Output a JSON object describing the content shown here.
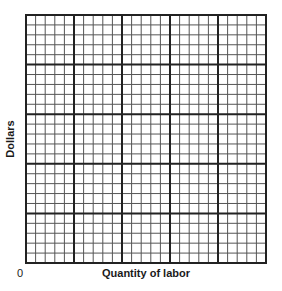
{
  "chart_data": {
    "type": "grid",
    "title": "",
    "xlabel": "Quantity of labor",
    "ylabel": "Dollars",
    "origin_label": "0",
    "grid": {
      "columns": 25,
      "rows": 25,
      "major_every": 5,
      "minor_color": "#555555",
      "major_color": "#222222",
      "border_color": "#222222"
    },
    "series": [],
    "xlim": [
      0,
      25
    ],
    "ylim": [
      0,
      25
    ]
  }
}
